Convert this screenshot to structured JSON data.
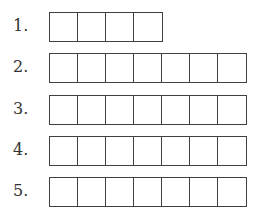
{
  "rows": [
    {
      "label": "1.",
      "cells": 4,
      "top": 12
    },
    {
      "label": "2.",
      "cells": 7,
      "top": 53
    },
    {
      "label": "3.",
      "cells": 7,
      "top": 95
    },
    {
      "label": "4.",
      "cells": 7,
      "top": 136
    },
    {
      "label": "5.",
      "cells": 7,
      "top": 177
    }
  ],
  "colors": {
    "line": "#404040",
    "text": "#333333",
    "background": "#ffffff"
  }
}
